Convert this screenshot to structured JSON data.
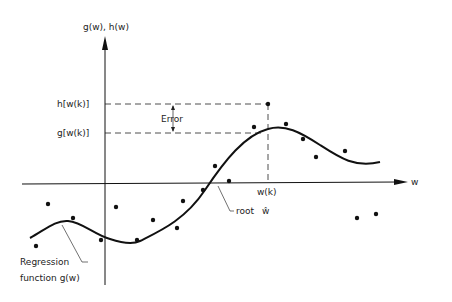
{
  "labels": {
    "y_axis": "g(w), h(w)",
    "x_axis": "w",
    "h_label": "h[w(k)]",
    "g_label": "g[w(k)]",
    "error": "Error",
    "wk": "w(k)",
    "root": "root",
    "root_symbol": "ŵ",
    "regression_line1": "Regression",
    "regression_line2": "function g(w)"
  },
  "colors": {
    "ink": "#111111",
    "background": "#ffffff"
  },
  "data_points": [
    [
      36,
      246
    ],
    [
      48,
      204
    ],
    [
      73,
      218
    ],
    [
      101,
      240
    ],
    [
      116,
      207
    ],
    [
      137,
      240
    ],
    [
      153,
      220
    ],
    [
      177,
      228
    ],
    [
      183,
      201
    ],
    [
      203,
      190
    ],
    [
      215,
      166
    ],
    [
      229,
      181
    ],
    [
      253,
      127
    ],
    [
      268,
      104
    ],
    [
      286,
      124
    ],
    [
      303,
      140
    ],
    [
      316,
      157
    ],
    [
      345,
      150
    ],
    [
      357,
      219
    ],
    [
      376,
      214
    ]
  ]
}
